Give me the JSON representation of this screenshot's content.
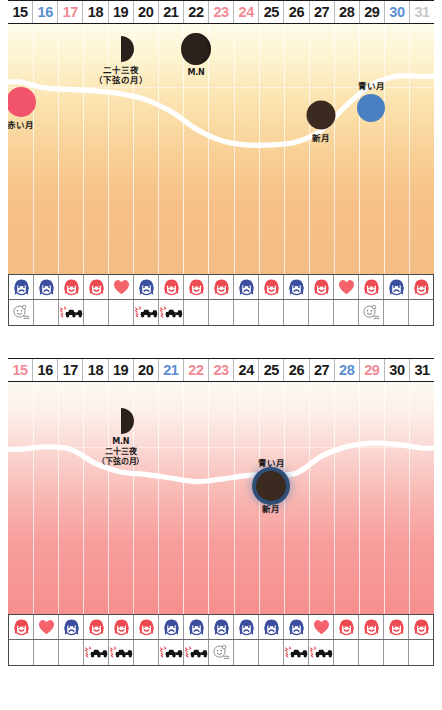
{
  "colors": {
    "day_black": "#1a1a1a",
    "day_blue": "#5b8fd4",
    "day_red": "#f28a93",
    "day_grey": "#c8c8c8",
    "face_blue": "#3b4f9e",
    "face_red": "#ee4a52",
    "heart_red": "#f4626c",
    "curve": "#ffffff",
    "red_moon": "#f0536b",
    "blue_moon": "#4a7fc1",
    "new_moon": "#3b2a20",
    "chart1_bg_top": "#fdfbe9",
    "chart1_bg_bottom": "#f5bd86",
    "chart2_bg_top": "#fdf9f2",
    "chart2_bg_bottom": "#f6908f"
  },
  "chart_data": [
    {
      "id": "chart1",
      "type": "line",
      "title": "",
      "xlabel": "",
      "ylabel": "",
      "grid": true,
      "legend": "none",
      "categories": [
        "15",
        "16",
        "17",
        "18",
        "19",
        "20",
        "21",
        "22",
        "23",
        "24",
        "25",
        "26",
        "27",
        "28",
        "29",
        "30",
        "31"
      ],
      "day_colors": [
        "#1a1a1a",
        "#5b8fd4",
        "#f28a93",
        "#1a1a1a",
        "#1a1a1a",
        "#1a1a1a",
        "#1a1a1a",
        "#1a1a1a",
        "#f28a93",
        "#f28a93",
        "#1a1a1a",
        "#1a1a1a",
        "#1a1a1a",
        "#1a1a1a",
        "#1a1a1a",
        "#5b8fd4",
        "#c8c8c8"
      ],
      "ylim": [
        0,
        100
      ],
      "values": [
        78,
        74,
        73,
        72,
        70,
        66,
        58,
        46,
        38,
        35,
        35,
        37,
        45,
        62,
        76,
        82,
        82
      ],
      "annotations": [
        {
          "name": "red-moon",
          "label": "赤い月",
          "day": "15",
          "x_pct": 6.6,
          "y_pct": 8,
          "kind": "circle",
          "color": "#f0536b",
          "size": 30,
          "label_pos": "below"
        },
        {
          "name": "half-moon-23rd-night",
          "label": "二十三夜",
          "sublabel": "（下弦の月）",
          "day": "19",
          "x_pct": 29.5,
          "y_pct": -18,
          "kind": "half",
          "label_pos": "below"
        },
        {
          "name": "gibbous-moon-mn",
          "label": "M.N",
          "day": "22",
          "x_pct": 50.5,
          "y_pct": -32,
          "kind": "gibbous",
          "label_pos": "below"
        },
        {
          "name": "new-moon",
          "label": "新月",
          "day": "27",
          "x_pct": 72.0,
          "y_pct": -6,
          "kind": "circle",
          "color": "#3b2a20",
          "size": 29,
          "label_pos": "below"
        },
        {
          "name": "blue-moon",
          "label": "青い月",
          "day": "29",
          "x_pct": 83.0,
          "y_pct": 9,
          "kind": "circle",
          "color": "#4a7fc1",
          "size": 28,
          "label_pos": "above"
        }
      ],
      "icon_row_1": [
        "face-blue",
        "face-blue",
        "face-red",
        "face-red",
        "heart",
        "face-blue",
        "face-red",
        "face-red",
        "face-red",
        "face-blue",
        "face-red",
        "face-blue",
        "face-red",
        "heart",
        "face-red",
        "face-blue",
        "face-red"
      ],
      "icon_row_2": [
        "baby",
        "",
        "car",
        "",
        "",
        "car",
        "car",
        "",
        "",
        "",
        "",
        "",
        "",
        "",
        "baby",
        "",
        ""
      ]
    },
    {
      "id": "chart2",
      "type": "line",
      "title": "",
      "xlabel": "",
      "ylabel": "",
      "grid": true,
      "legend": "none",
      "categories": [
        "15",
        "16",
        "17",
        "18",
        "19",
        "20",
        "21",
        "22",
        "23",
        "24",
        "25",
        "26",
        "27",
        "28",
        "29",
        "30",
        "31"
      ],
      "day_colors": [
        "#f28a93",
        "#1a1a1a",
        "#1a1a1a",
        "#1a1a1a",
        "#1a1a1a",
        "#1a1a1a",
        "#5b8fd4",
        "#f28a93",
        "#f28a93",
        "#1a1a1a",
        "#1a1a1a",
        "#1a1a1a",
        "#1a1a1a",
        "#5b8fd4",
        "#f28a93",
        "#1a1a1a",
        "#1a1a1a"
      ],
      "ylim": [
        0,
        100
      ],
      "values": [
        74,
        76,
        74,
        62,
        55,
        53,
        50,
        47,
        49,
        52,
        53,
        54,
        68,
        76,
        79,
        78,
        75
      ],
      "annotations": [
        {
          "name": "half-moon-23rd-night",
          "label": "M.N",
          "sublabel": "二十三夜",
          "sublabel2": "（下弦の月）",
          "day": "19",
          "x_pct": 28.0,
          "y_pct": -22,
          "kind": "half",
          "label_pos": "below"
        },
        {
          "name": "blue-new-moon",
          "label": "青い月",
          "sublabel": "新月",
          "day": "25",
          "x_pct": 65.0,
          "y_pct": 5,
          "kind": "ringed",
          "color": "#3b2a20",
          "ring": "#2f4f77",
          "size": 30,
          "label_pos": "both"
        }
      ],
      "icon_row_1": [
        "face-red",
        "heart",
        "face-blue",
        "face-red",
        "face-red",
        "face-red",
        "face-blue",
        "face-blue",
        "face-blue",
        "face-blue",
        "face-blue",
        "face-blue",
        "heart",
        "face-red",
        "face-red",
        "face-red",
        "face-red"
      ],
      "icon_row_2": [
        "",
        "",
        "",
        "car",
        "car",
        "",
        "car",
        "car",
        "baby",
        "",
        "",
        "car",
        "car",
        "",
        "",
        "",
        ""
      ]
    }
  ]
}
